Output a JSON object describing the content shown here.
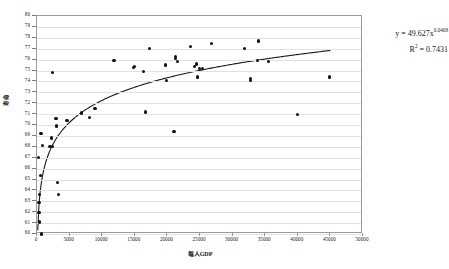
{
  "chart_data": {
    "type": "scatter",
    "title": "",
    "xlabel": "每人GDP",
    "ylabel": "寿命",
    "xlim": [
      0,
      50000
    ],
    "ylim": [
      60,
      80
    ],
    "xticks": [
      0,
      5000,
      10000,
      15000,
      20000,
      25000,
      30000,
      35000,
      40000,
      45000,
      50000
    ],
    "yticks": [
      60,
      61,
      62,
      63,
      64,
      65,
      66,
      67,
      68,
      69,
      70,
      71,
      72,
      73,
      74,
      75,
      76,
      77,
      78,
      79,
      80
    ],
    "grid": "horizontal",
    "legend": "none",
    "marker_color": "#111111",
    "gridline_color": "#e2e2e2",
    "trendline_color": "#1a1a1a",
    "series": [
      {
        "name": "寿命 vs 每人GDP",
        "points": [
          [
            700,
            60.0
          ],
          [
            350,
            61.1
          ],
          [
            300,
            62.0
          ],
          [
            300,
            62.9
          ],
          [
            400,
            63.6
          ],
          [
            3300,
            63.6
          ],
          [
            3100,
            64.7
          ],
          [
            500,
            65.4
          ],
          [
            250,
            67.0
          ],
          [
            2000,
            68.0
          ],
          [
            2400,
            68.0
          ],
          [
            800,
            68.1
          ],
          [
            2200,
            68.8
          ],
          [
            600,
            69.2
          ],
          [
            3000,
            69.9
          ],
          [
            2900,
            70.6
          ],
          [
            4600,
            70.4
          ],
          [
            6800,
            71.1
          ],
          [
            8000,
            70.7
          ],
          [
            16600,
            71.2
          ],
          [
            40000,
            71.0
          ],
          [
            8900,
            71.5
          ],
          [
            21000,
            69.4
          ],
          [
            19900,
            74.1
          ],
          [
            32700,
            74.3
          ],
          [
            32700,
            74.1
          ],
          [
            44800,
            74.4
          ],
          [
            2400,
            74.8
          ],
          [
            16300,
            74.9
          ],
          [
            24600,
            74.4
          ],
          [
            24900,
            75.2
          ],
          [
            25400,
            75.2
          ],
          [
            24200,
            75.4
          ],
          [
            24500,
            75.6
          ],
          [
            14800,
            75.3
          ],
          [
            15000,
            75.4
          ],
          [
            19700,
            75.5
          ],
          [
            21600,
            75.8
          ],
          [
            21300,
            76.1
          ],
          [
            21300,
            76.3
          ],
          [
            11800,
            75.9
          ],
          [
            33800,
            75.9
          ],
          [
            35500,
            75.8
          ],
          [
            17200,
            77.0
          ],
          [
            31800,
            77.0
          ],
          [
            23600,
            77.2
          ],
          [
            26800,
            77.5
          ],
          [
            34000,
            77.7
          ]
        ]
      }
    ],
    "trendline": {
      "type": "power",
      "equation": "y = 49.627x",
      "exponent": "0.0408",
      "r2_label": "R",
      "r2_sup": "2",
      "r2_value": "= 0.7431",
      "coefficient": 49.627,
      "power": 0.0408,
      "x_start": 120,
      "x_end": 45000
    }
  }
}
